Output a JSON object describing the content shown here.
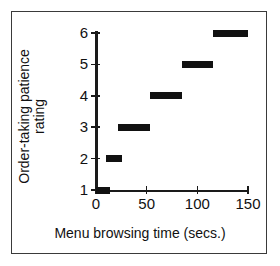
{
  "chart_data": {
    "type": "bar",
    "orientation": "horizontal-intervals",
    "title": "",
    "xlabel": "Menu browsing time (secs.)",
    "ylabel": "Order-taking patience rating",
    "ylabel_line1": "Order-taking patience",
    "ylabel_line2": "rating",
    "xlim": [
      0,
      150
    ],
    "ylim": [
      1,
      6
    ],
    "xticks": [
      0,
      50,
      100,
      150
    ],
    "xtick_labels": [
      "0",
      "50",
      "100",
      "150"
    ],
    "yticks": [
      1,
      2,
      3,
      4,
      5,
      6
    ],
    "ytick_labels": [
      "1",
      "2",
      "3",
      "4",
      "5",
      "6"
    ],
    "grid": false,
    "legend": false,
    "legend_position": "none",
    "series": [
      {
        "name": "Patience rating interval",
        "color": "#111111",
        "intervals": [
          {
            "rating": 1,
            "x_start": 0,
            "x_end": 14
          },
          {
            "rating": 2,
            "x_start": 10,
            "x_end": 26
          },
          {
            "rating": 3,
            "x_start": 22,
            "x_end": 53
          },
          {
            "rating": 4,
            "x_start": 53,
            "x_end": 85
          },
          {
            "rating": 5,
            "x_start": 85,
            "x_end": 115
          },
          {
            "rating": 6,
            "x_start": 115,
            "x_end": 150
          }
        ]
      }
    ]
  },
  "colors": {
    "bar": "#111111",
    "axis": "#1a1a1a",
    "frame": "#3a3a3a",
    "background": "#ffffff"
  }
}
